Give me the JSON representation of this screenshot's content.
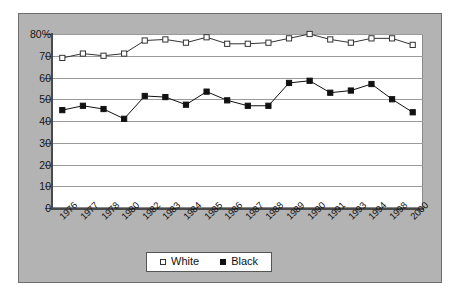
{
  "chart_data": {
    "type": "line",
    "title": "",
    "xlabel": "",
    "ylabel": "",
    "ylim": [
      0,
      80
    ],
    "ytick_step": 10,
    "ytick_labels": [
      "80%",
      "70",
      "60",
      "50",
      "40",
      "30",
      "20",
      "10",
      "0"
    ],
    "ytick_values": [
      80,
      70,
      60,
      50,
      40,
      30,
      20,
      10,
      0
    ],
    "grid": true,
    "legend_position": "bottom-center",
    "categories": [
      "1976",
      "1977",
      "1978",
      "1980",
      "1982",
      "1983",
      "1984",
      "1985",
      "1986",
      "1987",
      "1988",
      "1989",
      "1990",
      "1991",
      "1993",
      "1994",
      "1998",
      "2000"
    ],
    "series": [
      {
        "name": "White",
        "marker": "open-square",
        "color": "#333333",
        "values": [
          69,
          71,
          70,
          71,
          77,
          77.5,
          76,
          78.5,
          75.5,
          75.5,
          76,
          78,
          80,
          77.5,
          76,
          78,
          78,
          75
        ]
      },
      {
        "name": "Black",
        "marker": "filled-square",
        "color": "#111111",
        "values": [
          45,
          47,
          45.5,
          41,
          51.5,
          51,
          47.5,
          53.5,
          49.5,
          47,
          47,
          57.5,
          58.5,
          53,
          54,
          57,
          50,
          44
        ]
      }
    ]
  },
  "legend": {
    "entries": [
      {
        "label": "White",
        "marker": "open-square"
      },
      {
        "label": "Black",
        "marker": "filled-square"
      }
    ]
  }
}
